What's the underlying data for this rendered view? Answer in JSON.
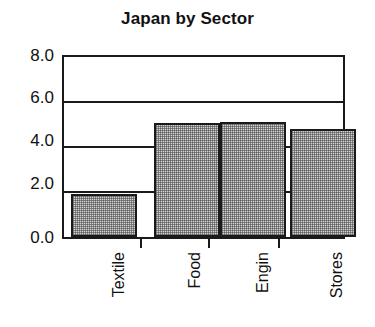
{
  "chart_data": {
    "type": "bar",
    "title": "Japan by Sector",
    "xlabel": "",
    "ylabel": "",
    "categories": [
      "Textile",
      "Food",
      "Engin",
      "Stores"
    ],
    "values": [
      1.9,
      5.05,
      5.1,
      4.8
    ],
    "ylim": [
      0.0,
      8.0
    ],
    "y_ticks": [
      "0.0",
      "2.0",
      "4.0",
      "6.0",
      "8.0"
    ],
    "y_tick_values": [
      0.0,
      2.0,
      4.0,
      6.0,
      8.0
    ],
    "grid": "horizontal",
    "legend": "none",
    "bar_fill": "#d2d2d2",
    "bar_border": "#1a1a1a",
    "axis_color": "#1a1a1a",
    "background": "#ffffff",
    "x_label_rotation": -90
  }
}
